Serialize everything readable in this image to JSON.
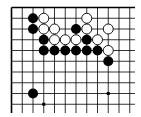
{
  "board": {
    "description": "Go problem diagram (top-left corner fragment)",
    "columns": 12,
    "rows": 10,
    "edges": [
      "top",
      "left"
    ],
    "colors": {
      "background": "#ffffff",
      "line": "#000000",
      "black": "#000000",
      "white": "#ffffff"
    },
    "star_points": [
      [
        9,
        2
      ],
      [
        9,
        8
      ],
      [
        3,
        9
      ]
    ],
    "stones": [
      {
        "color": "black",
        "col": 2,
        "row": 1
      },
      {
        "color": "white",
        "col": 3,
        "row": 1
      },
      {
        "color": "white",
        "col": 7,
        "row": 1
      },
      {
        "color": "black",
        "col": 2,
        "row": 2
      },
      {
        "color": "white",
        "col": 3,
        "row": 2
      },
      {
        "color": "white",
        "col": 4,
        "row": 2
      },
      {
        "color": "black",
        "col": 6,
        "row": 2
      },
      {
        "color": "white",
        "col": 7,
        "row": 2
      },
      {
        "color": "white",
        "col": 9,
        "row": 2
      },
      {
        "color": "black",
        "col": 3,
        "row": 3
      },
      {
        "color": "white",
        "col": 4,
        "row": 3
      },
      {
        "color": "white",
        "col": 5,
        "row": 3
      },
      {
        "color": "white",
        "col": 6,
        "row": 3
      },
      {
        "color": "black",
        "col": 7,
        "row": 3
      },
      {
        "color": "white",
        "col": 8,
        "row": 3
      },
      {
        "color": "black",
        "col": 3,
        "row": 4
      },
      {
        "color": "black",
        "col": 4,
        "row": 4
      },
      {
        "color": "black",
        "col": 5,
        "row": 4
      },
      {
        "color": "black",
        "col": 6,
        "row": 4
      },
      {
        "color": "black",
        "col": 7,
        "row": 4
      },
      {
        "color": "black",
        "col": 8,
        "row": 4
      },
      {
        "color": "white",
        "col": 9,
        "row": 4
      },
      {
        "color": "black",
        "col": 9,
        "row": 5
      },
      {
        "color": "black",
        "col": 2,
        "row": 8
      }
    ]
  }
}
